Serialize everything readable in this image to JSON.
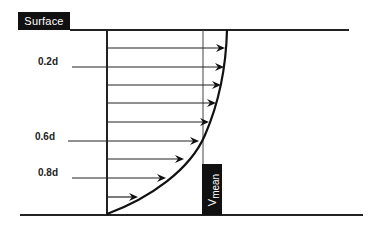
{
  "diagram": {
    "surface_label": "Surface",
    "depth_labels": [
      {
        "text": "0.2d",
        "y": 67
      },
      {
        "text": "0.6d",
        "y": 141
      },
      {
        "text": "0.8d",
        "y": 178
      }
    ],
    "vmean_label": {
      "main": "V",
      "sub": "mean"
    },
    "colors": {
      "line": "#222222",
      "label_bg": "#111111",
      "label_fg": "#ffffff"
    },
    "velocity_arrows": [
      {
        "y": 48,
        "tip_x": 225
      },
      {
        "y": 67,
        "tip_x": 224
      },
      {
        "y": 85,
        "tip_x": 221
      },
      {
        "y": 103,
        "tip_x": 216
      },
      {
        "y": 122,
        "tip_x": 209
      },
      {
        "y": 141,
        "tip_x": 199
      },
      {
        "y": 159,
        "tip_x": 184
      },
      {
        "y": 178,
        "tip_x": 166
      },
      {
        "y": 197,
        "tip_x": 138
      }
    ]
  }
}
